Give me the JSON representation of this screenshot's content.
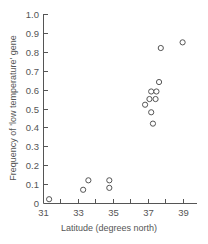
{
  "chart_data": {
    "type": "scatter",
    "title": "",
    "xlabel": "Latitude (degrees north)",
    "ylabel": "Frequency of 'low temperature' gene",
    "xlim": [
      31,
      40
    ],
    "ylim": [
      0,
      1.0
    ],
    "x_ticks": [
      31,
      33,
      35,
      37,
      39
    ],
    "x_minor_ticks": [
      32,
      34,
      36,
      38
    ],
    "y_ticks": [
      0,
      0.1,
      0.2,
      0.3,
      0.4,
      0.5,
      0.6,
      0.7,
      0.8,
      0.9,
      1.0
    ],
    "y_tick_labels": [
      "0",
      "0.1",
      "0.2",
      "0.3",
      "0.4",
      "0.5",
      "0.6",
      "0.7",
      "0.8",
      "0.9",
      "1.0"
    ],
    "grid": false,
    "legend": null,
    "marker": "open-circle",
    "series": [
      {
        "name": "populations",
        "points": [
          {
            "x": 31.35,
            "y": 0.02
          },
          {
            "x": 33.3,
            "y": 0.07
          },
          {
            "x": 33.6,
            "y": 0.12
          },
          {
            "x": 34.8,
            "y": 0.08
          },
          {
            "x": 34.8,
            "y": 0.12
          },
          {
            "x": 36.85,
            "y": 0.52
          },
          {
            "x": 37.1,
            "y": 0.55
          },
          {
            "x": 37.2,
            "y": 0.59
          },
          {
            "x": 37.2,
            "y": 0.48
          },
          {
            "x": 37.3,
            "y": 0.42
          },
          {
            "x": 37.45,
            "y": 0.55
          },
          {
            "x": 37.5,
            "y": 0.59
          },
          {
            "x": 37.65,
            "y": 0.64
          },
          {
            "x": 37.75,
            "y": 0.82
          },
          {
            "x": 39.0,
            "y": 0.85
          }
        ]
      }
    ]
  },
  "colors": {
    "axis": "#555555",
    "text": "#555555",
    "marker_stroke": "#555555",
    "background": "#ffffff"
  }
}
